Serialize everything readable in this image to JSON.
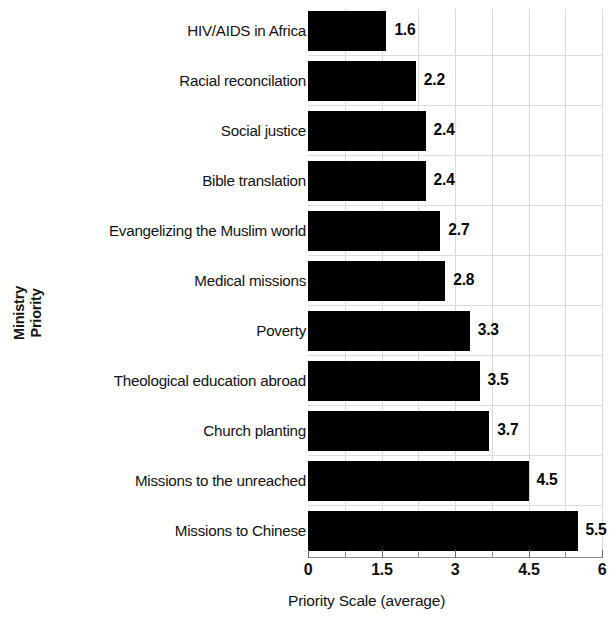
{
  "chart_data": {
    "type": "bar",
    "orientation": "horizontal",
    "title": "",
    "xlabel": "Priority Scale (average)",
    "ylabel": "Ministry\nPriority",
    "categories": [
      "HIV/AIDS in Africa",
      "Racial reconcilation",
      "Social justice",
      "Bible translation",
      "Evangelizing the Muslim world",
      "Medical missions",
      "Poverty",
      "Theological education abroad",
      "Church planting",
      "Missions to the unreached",
      "Missions to Chinese"
    ],
    "values": [
      1.6,
      2.2,
      2.4,
      2.4,
      2.7,
      2.8,
      3.3,
      3.5,
      3.7,
      4.5,
      5.5
    ],
    "value_labels": [
      "1.6",
      "2.2",
      "2.4",
      "2.4",
      "2.7",
      "2.8",
      "3.3",
      "3.5",
      "3.7",
      "4.5",
      "5.5"
    ],
    "xlim": [
      0,
      6
    ],
    "xticks": [
      0,
      0.75,
      1.5,
      2.25,
      3,
      3.75,
      4.5,
      5.25,
      6
    ],
    "xtick_labels": [
      "0",
      "",
      "1.5",
      "",
      "3",
      "",
      "4.5",
      "",
      "6"
    ],
    "grid": true,
    "legend": false,
    "bar_color": "#000000",
    "grid_color": "#d8d8d8",
    "axis_color": "#8e8e8e",
    "text_color": "#121212"
  }
}
